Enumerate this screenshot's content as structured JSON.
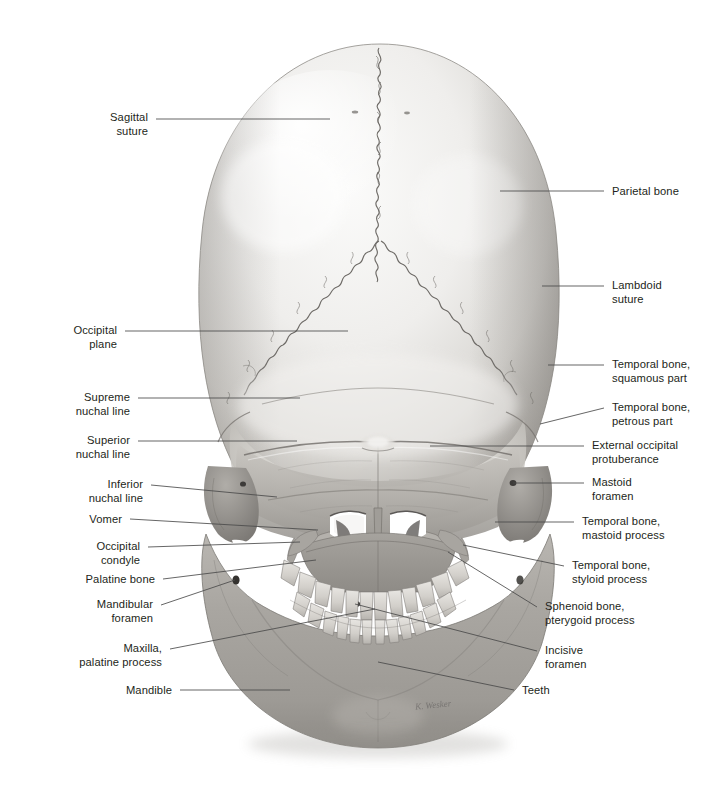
{
  "figure": {
    "view": "posterior (occipital) view of the human skull",
    "background_color": "#ffffff",
    "label_color": "#231f20",
    "leader_color": "#4a4a4a",
    "bone_light": "#f2f1ef",
    "bone_mid": "#cfcdc9",
    "bone_dark": "#8d8b87",
    "signature": "K. Wesker"
  },
  "labels_left": [
    {
      "id": "sagittal-suture",
      "text": "Sagittal\nsuture",
      "text_x": 148,
      "text_y": 124,
      "leader": [
        [
          156,
          119
        ],
        [
          330,
          119
        ]
      ]
    },
    {
      "id": "occipital-plane",
      "text": "Occipital\nplane",
      "text_x": 117,
      "text_y": 337,
      "leader": [
        [
          125,
          331
        ],
        [
          348,
          331
        ]
      ]
    },
    {
      "id": "supreme-nuchal-line",
      "text": "Supreme\nnuchal line",
      "text_x": 130,
      "text_y": 404,
      "leader": [
        [
          138,
          398
        ],
        [
          300,
          398
        ]
      ]
    },
    {
      "id": "superior-nuchal-line",
      "text": "Superior\nnuchal line",
      "text_x": 130,
      "text_y": 447,
      "leader": [
        [
          138,
          441
        ],
        [
          297,
          441
        ]
      ]
    },
    {
      "id": "inferior-nuchal-line",
      "text": "Inferior\nnuchal line",
      "text_x": 143,
      "text_y": 491,
      "leader": [
        [
          151,
          485
        ],
        [
          277,
          497
        ]
      ]
    },
    {
      "id": "vomer",
      "text": "Vomer",
      "text_x": 122,
      "text_y": 519,
      "leader": [
        [
          130,
          519
        ],
        [
          318,
          530
        ]
      ]
    },
    {
      "id": "occipital-condyle",
      "text": "Occipital\ncondyle",
      "text_x": 140,
      "text_y": 553,
      "leader": [
        [
          148,
          547
        ],
        [
          300,
          542
        ]
      ]
    },
    {
      "id": "palatine-bone",
      "text": "Palatine bone",
      "text_x": 155,
      "text_y": 579,
      "leader": [
        [
          163,
          579
        ],
        [
          316,
          560
        ]
      ]
    },
    {
      "id": "mandibular-foramen",
      "text": "Mandibular\nforamen",
      "text_x": 153,
      "text_y": 611,
      "leader": [
        [
          161,
          605
        ],
        [
          235,
          580
        ]
      ]
    },
    {
      "id": "maxilla-palatine-process",
      "text": "Maxilla,\npalatine process",
      "text_x": 162,
      "text_y": 655,
      "leader": [
        [
          170,
          649
        ],
        [
          375,
          609
        ]
      ]
    },
    {
      "id": "mandible",
      "text": "Mandible",
      "text_x": 172,
      "text_y": 690,
      "leader": [
        [
          180,
          690
        ],
        [
          290,
          690
        ]
      ]
    }
  ],
  "labels_right": [
    {
      "id": "parietal-bone",
      "text": "Parietal bone",
      "text_x": 612,
      "text_y": 191,
      "leader": [
        [
          604,
          191
        ],
        [
          500,
          191
        ]
      ]
    },
    {
      "id": "lambdoid-suture",
      "text": "Lambdoid\nsuture",
      "text_x": 612,
      "text_y": 292,
      "leader": [
        [
          604,
          286
        ],
        [
          542,
          286
        ]
      ]
    },
    {
      "id": "temporal-squamous",
      "text": "Temporal bone,\nsquamous part",
      "text_x": 612,
      "text_y": 371,
      "leader": [
        [
          604,
          365
        ],
        [
          548,
          365
        ]
      ]
    },
    {
      "id": "temporal-petrous",
      "text": "Temporal bone,\npetrous part",
      "text_x": 612,
      "text_y": 414,
      "leader": [
        [
          604,
          408
        ],
        [
          540,
          424
        ]
      ]
    },
    {
      "id": "external-occipital-protuberance",
      "text": "External occipital\nprotuberance",
      "text_x": 592,
      "text_y": 452,
      "leader": [
        [
          584,
          446
        ],
        [
          430,
          446
        ]
      ]
    },
    {
      "id": "mastoid-foramen",
      "text": "Mastoid\nforamen",
      "text_x": 592,
      "text_y": 489,
      "leader": [
        [
          584,
          483
        ],
        [
          513,
          483
        ]
      ]
    },
    {
      "id": "temporal-mastoid-process",
      "text": "Temporal bone,\nmastoid process",
      "text_x": 582,
      "text_y": 528,
      "leader": [
        [
          574,
          522
        ],
        [
          495,
          522
        ]
      ]
    },
    {
      "id": "temporal-styloid-process",
      "text": "Temporal bone,\nstyloid process",
      "text_x": 572,
      "text_y": 572,
      "leader": [
        [
          564,
          566
        ],
        [
          463,
          545
        ]
      ]
    },
    {
      "id": "sphenoid-pterygoid-process",
      "text": "Sphenoid bone,\npterygoid process",
      "text_x": 545,
      "text_y": 613,
      "leader": [
        [
          537,
          607
        ],
        [
          448,
          552
        ]
      ]
    },
    {
      "id": "incisive-foramen",
      "text": "Incisive\nforamen",
      "text_x": 545,
      "text_y": 657,
      "leader": [
        [
          537,
          651
        ],
        [
          355,
          604
        ]
      ]
    },
    {
      "id": "teeth",
      "text": "Teeth",
      "text_x": 522,
      "text_y": 690,
      "leader": [
        [
          514,
          690
        ],
        [
          378,
          662
        ]
      ]
    }
  ]
}
